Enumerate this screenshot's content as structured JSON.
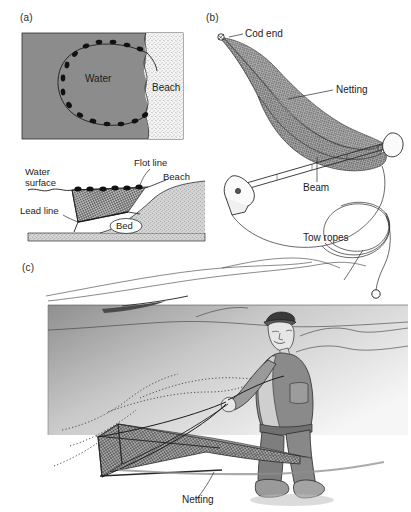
{
  "figure": {
    "panels": [
      {
        "id": "a",
        "label": "(a)",
        "type": "beach-seine-plan-and-section",
        "plan_view": {
          "labels": [
            {
              "name": "water",
              "text": "Water"
            },
            {
              "name": "beach",
              "text": "Beach"
            }
          ],
          "water_fill": "#8c8c8c",
          "beach_fill": "#f2f2f2",
          "float_count": 18
        },
        "section_view": {
          "labels": [
            {
              "name": "water-surface",
              "text": "Water\nsurface",
              "line1": "Water",
              "line2": "surface"
            },
            {
              "name": "flot-line",
              "text": "Flot line"
            },
            {
              "name": "lead-line",
              "text": "Lead line"
            },
            {
              "name": "beach",
              "text": "Beach"
            },
            {
              "name": "bed",
              "text": "Bed"
            }
          ],
          "float_count": 7
        }
      },
      {
        "id": "b",
        "label": "(b)",
        "type": "beam-trawl-perspective",
        "labels": [
          {
            "name": "cod-end",
            "text": "Cod end"
          },
          {
            "name": "netting",
            "text": "Netting"
          },
          {
            "name": "beam",
            "text": "Beam"
          },
          {
            "name": "tow-ropes",
            "text": "Tow ropes"
          }
        ]
      },
      {
        "id": "c",
        "label": "(c)",
        "type": "fisherman-hauling-net-scene",
        "labels": [
          {
            "name": "netting",
            "text": "Netting"
          }
        ]
      }
    ]
  },
  "colors": {
    "water_gray": "#8c8c8c",
    "sand_light": "#f2f2f2",
    "net_gray": "#8e8e8e",
    "ink": "#1c1c1c",
    "figure_body": "#6e6e6e",
    "line": "#2a2a2a"
  }
}
